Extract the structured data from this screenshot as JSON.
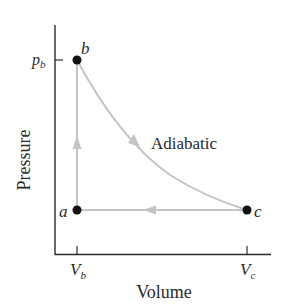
{
  "diagram": {
    "type": "pV-diagram",
    "axes": {
      "x_label": "Volume",
      "y_label": "Pressure",
      "x_ticks": [
        {
          "main": "V",
          "sub": "b"
        },
        {
          "main": "V",
          "sub": "c"
        }
      ],
      "y_ticks": [
        {
          "main": "p",
          "sub": "b"
        }
      ]
    },
    "points": [
      {
        "label": "a",
        "position": "lower-left"
      },
      {
        "label": "b",
        "position": "upper-left"
      },
      {
        "label": "c",
        "position": "lower-right"
      }
    ],
    "process_labels": {
      "b_to_c": "Adiabatic"
    },
    "processes": [
      {
        "from": "b",
        "to": "c",
        "kind": "Adiabatic",
        "arrow": "down-right"
      },
      {
        "from": "c",
        "to": "a",
        "kind": "isobaric",
        "arrow": "left"
      },
      {
        "from": "a",
        "to": "b",
        "kind": "isochoric",
        "arrow": "up"
      }
    ],
    "colors": {
      "axis": "#2a2a2a",
      "path": "#c4c4c4",
      "point": "#111111"
    }
  }
}
